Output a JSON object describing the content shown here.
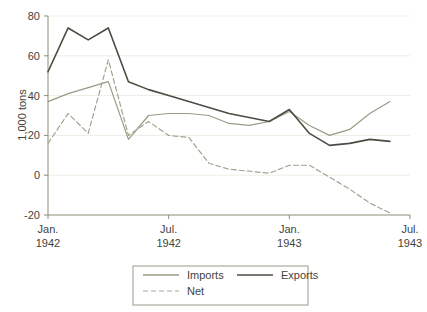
{
  "chart_data": {
    "type": "line",
    "title": "",
    "subtitle": "",
    "xlabel": "",
    "ylabel": "1,000 tons",
    "ylim": [
      -20,
      80
    ],
    "xlim": [
      0,
      18
    ],
    "grid": true,
    "grid_axis": "y",
    "legend_position": "bottom",
    "y_ticks": [
      80,
      60,
      40,
      20,
      0,
      -20
    ],
    "y_tick_labels": [
      "80",
      "60",
      "40",
      "20",
      "0",
      "-20"
    ],
    "x_ticks": [
      0,
      6,
      12,
      18
    ],
    "x_tick_labels": [
      {
        "line1": "Jan.",
        "line2": "1942"
      },
      {
        "line1": "Jul.",
        "line2": "1942"
      },
      {
        "line1": "Jan.",
        "line2": "1943"
      },
      {
        "line1": "Jul.",
        "line2": "1943"
      }
    ],
    "x": [
      0,
      1,
      2,
      3,
      4,
      5,
      6,
      7,
      8,
      9,
      10,
      11,
      12,
      13,
      14,
      15,
      16,
      17
    ],
    "series": [
      {
        "name": "Imports",
        "style": "solid",
        "color": "#9a9a86",
        "width": 1.2,
        "values": [
          37,
          41,
          44,
          47,
          18,
          30,
          31,
          31,
          30,
          26,
          25,
          27,
          32,
          25,
          20,
          23,
          31,
          37
        ]
      },
      {
        "name": "Exports",
        "style": "solid",
        "color": "#4c4c42",
        "width": 1.6,
        "values": [
          52,
          74,
          68,
          74,
          47,
          43,
          40,
          37,
          34,
          31,
          29,
          27,
          33,
          21,
          15,
          16,
          18,
          17
        ]
      },
      {
        "name": "Net",
        "style": "dashed",
        "color": "#a3a38f",
        "width": 1.2,
        "values": [
          16,
          31,
          21,
          58,
          20,
          27,
          20,
          19,
          6,
          3,
          2,
          1,
          5,
          5,
          -1,
          -7,
          -14,
          -19
        ]
      }
    ],
    "legend": [
      {
        "label": "Imports",
        "style": "solid",
        "color": "#9a9a86"
      },
      {
        "label": "Exports",
        "style": "solid",
        "color": "#4c4c42"
      },
      {
        "label": "Net",
        "style": "dashed",
        "color": "#a3a38f"
      }
    ],
    "colors": {
      "axis": "#8c8c7a",
      "grid": "#eeeee6",
      "text": "#43433c",
      "background": "#ffffff",
      "legend_border": "#9a9a8a"
    }
  }
}
